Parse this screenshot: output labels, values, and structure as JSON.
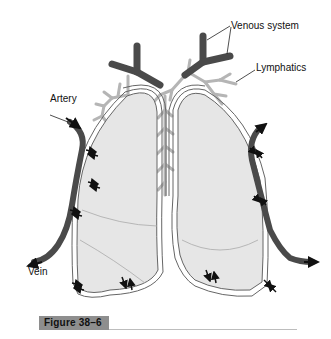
{
  "diagram": {
    "labels": {
      "venous_system": "Venous system",
      "lymphatics": "Lymphatics",
      "artery": "Artery",
      "vein": "Vein"
    },
    "caption": {
      "figure_label": "Figure 38–6"
    },
    "colors": {
      "vessel": "#4a4a4a",
      "lymphatic": "#b5b5b5",
      "lung_fill": "#e6e6e6",
      "pleura_line": "#666666",
      "caption_bg": "#8e8e8e"
    }
  }
}
